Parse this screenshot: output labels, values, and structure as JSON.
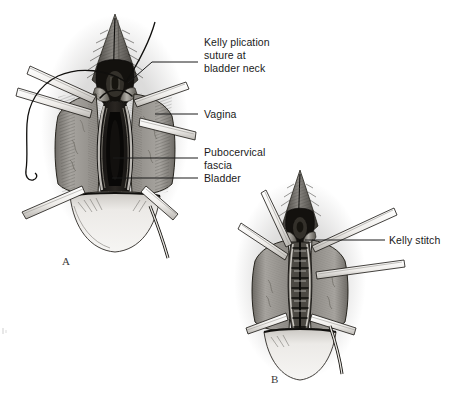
{
  "figure": {
    "type": "medical-surgical-illustration",
    "background_color": "#ffffff",
    "ink_color": "#1a1a1a",
    "tissue_color": "#9d9a96",
    "instrument_color": "#f2f0ec",
    "panels": [
      {
        "id": "A",
        "letter": "A",
        "description": "Anterior vaginal wall opened with retractors exposing pubocervical fascia and bladder; curved needle with suture placed at bladder neck"
      },
      {
        "id": "B",
        "letter": "B",
        "description": "Midline fascial plication completed with interrupted Kelly stitches closing the defect"
      }
    ],
    "labels": [
      {
        "id": "kelly-plication-suture",
        "text": "Kelly plication\nsuture at\nbladder neck",
        "lines": [
          "Kelly plication",
          "suture at",
          "bladder neck"
        ],
        "panel": "A",
        "leader": "elbow"
      },
      {
        "id": "vagina",
        "text": "Vagina",
        "lines": [
          "Vagina"
        ],
        "panel": "A",
        "leader": "horizontal"
      },
      {
        "id": "pubocervical-fascia",
        "text": "Pubocervical\nfascia",
        "lines": [
          "Pubocervical",
          "fascia"
        ],
        "panel": "A",
        "leader": "horizontal"
      },
      {
        "id": "bladder",
        "text": "Bladder",
        "lines": [
          "Bladder"
        ],
        "panel": "A",
        "leader": "horizontal"
      },
      {
        "id": "kelly-stitch",
        "text": "Kelly stitch",
        "lines": [
          "Kelly stitch"
        ],
        "panel": "B",
        "leader": "horizontal"
      }
    ]
  }
}
